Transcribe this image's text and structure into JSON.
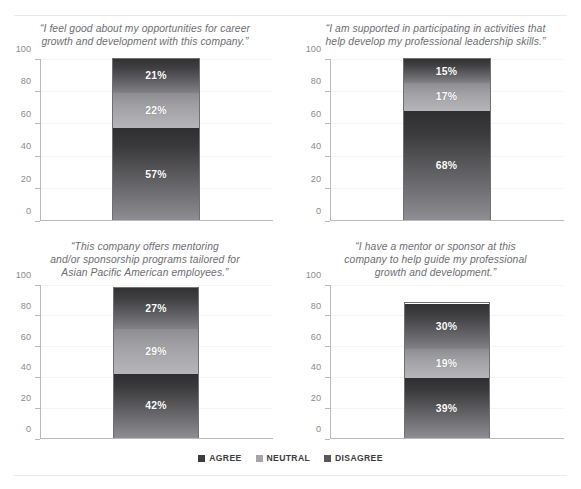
{
  "chart_data": [
    {
      "type": "bar",
      "title": "“I feel good about my opportunities for career\ngrowth and development with this company.”",
      "categories": [
        ""
      ],
      "series": [
        {
          "name": "AGREE",
          "values": [
            57
          ]
        },
        {
          "name": "NEUTRAL",
          "values": [
            22
          ]
        },
        {
          "name": "DISAGREE",
          "values": [
            21
          ]
        }
      ],
      "labels": [
        "57%",
        "22%",
        "21%"
      ],
      "xlabel": "",
      "ylabel": "",
      "ylim": [
        0,
        100
      ],
      "yticks": [
        0,
        20,
        40,
        60,
        80,
        100
      ],
      "grid": true,
      "stacked": true,
      "legend_position": "bottom"
    },
    {
      "type": "bar",
      "title": "“I am supported in participating in activities that\nhelp develop my professional leadership skills.”",
      "categories": [
        ""
      ],
      "series": [
        {
          "name": "AGREE",
          "values": [
            68
          ]
        },
        {
          "name": "NEUTRAL",
          "values": [
            17
          ]
        },
        {
          "name": "DISAGREE",
          "values": [
            15
          ]
        }
      ],
      "labels": [
        "68%",
        "17%",
        "15%"
      ],
      "xlabel": "",
      "ylabel": "",
      "ylim": [
        0,
        100
      ],
      "yticks": [
        0,
        20,
        40,
        60,
        80,
        100
      ],
      "grid": true,
      "stacked": true,
      "legend_position": "bottom"
    },
    {
      "type": "bar",
      "title": "“This company offers mentoring\nand/or sponsorship programs tailored for\nAsian Pacific American employees.”",
      "categories": [
        ""
      ],
      "series": [
        {
          "name": "AGREE",
          "values": [
            42
          ]
        },
        {
          "name": "NEUTRAL",
          "values": [
            29
          ]
        },
        {
          "name": "DISAGREE",
          "values": [
            27
          ]
        }
      ],
      "labels": [
        "42%",
        "29%",
        "27%"
      ],
      "xlabel": "",
      "ylabel": "",
      "ylim": [
        0,
        100
      ],
      "yticks": [
        0,
        20,
        40,
        60,
        80,
        100
      ],
      "grid": true,
      "stacked": true,
      "legend_position": "bottom"
    },
    {
      "type": "bar",
      "title": "“I have a mentor or sponsor at this\ncompany to help guide my professional\ngrowth and development.”",
      "categories": [
        ""
      ],
      "series": [
        {
          "name": "AGREE",
          "values": [
            39
          ]
        },
        {
          "name": "NEUTRAL",
          "values": [
            19
          ]
        },
        {
          "name": "DISAGREE",
          "values": [
            30
          ]
        }
      ],
      "labels": [
        "39%",
        "19%",
        "30%"
      ],
      "xlabel": "",
      "ylabel": "",
      "ylim": [
        0,
        100
      ],
      "yticks": [
        0,
        20,
        40,
        60,
        80,
        100
      ],
      "grid": true,
      "stacked": true,
      "legend_position": "bottom"
    }
  ],
  "panels": [
    {
      "title": "“I feel good about my opportunities for career\ngrowth and development with this company.”",
      "yticks": [
        "100",
        "80",
        "60",
        "40",
        "20",
        "0"
      ],
      "segments": [
        {
          "key": "agree",
          "label": "57%",
          "value": 57
        },
        {
          "key": "neutral",
          "label": "22%",
          "value": 22
        },
        {
          "key": "disagree",
          "label": "21%",
          "value": 21
        }
      ]
    },
    {
      "title": "“I am supported in participating in activities that\nhelp develop my professional leadership skills.”",
      "yticks": [
        "100",
        "80",
        "60",
        "40",
        "20",
        "0"
      ],
      "segments": [
        {
          "key": "agree",
          "label": "68%",
          "value": 68
        },
        {
          "key": "neutral",
          "label": "17%",
          "value": 17
        },
        {
          "key": "disagree",
          "label": "15%",
          "value": 15
        }
      ]
    },
    {
      "title": "“This company offers mentoring\nand/or sponsorship programs tailored for\nAsian Pacific American employees.”",
      "yticks": [
        "100",
        "80",
        "60",
        "40",
        "20",
        "0"
      ],
      "segments": [
        {
          "key": "agree",
          "label": "42%",
          "value": 42
        },
        {
          "key": "neutral",
          "label": "29%",
          "value": 29
        },
        {
          "key": "disagree",
          "label": "27%",
          "value": 27
        }
      ]
    },
    {
      "title": "“I have a mentor or sponsor at this\ncompany to help guide my professional\ngrowth and development.”",
      "yticks": [
        "100",
        "80",
        "60",
        "40",
        "20",
        "0"
      ],
      "segments": [
        {
          "key": "agree",
          "label": "39%",
          "value": 39
        },
        {
          "key": "neutral",
          "label": "19%",
          "value": 19
        },
        {
          "key": "disagree",
          "label": "30%",
          "value": 30
        }
      ]
    }
  ],
  "legend": {
    "items": [
      {
        "label": "AGREE",
        "color": "#3c3c3e"
      },
      {
        "label": "NEUTRAL",
        "color": "#a6a6aa"
      },
      {
        "label": "DISAGREE",
        "color": "#58585c"
      }
    ]
  },
  "axis": {
    "max": 100,
    "ticks": [
      100,
      80,
      60,
      40,
      20,
      0
    ]
  }
}
